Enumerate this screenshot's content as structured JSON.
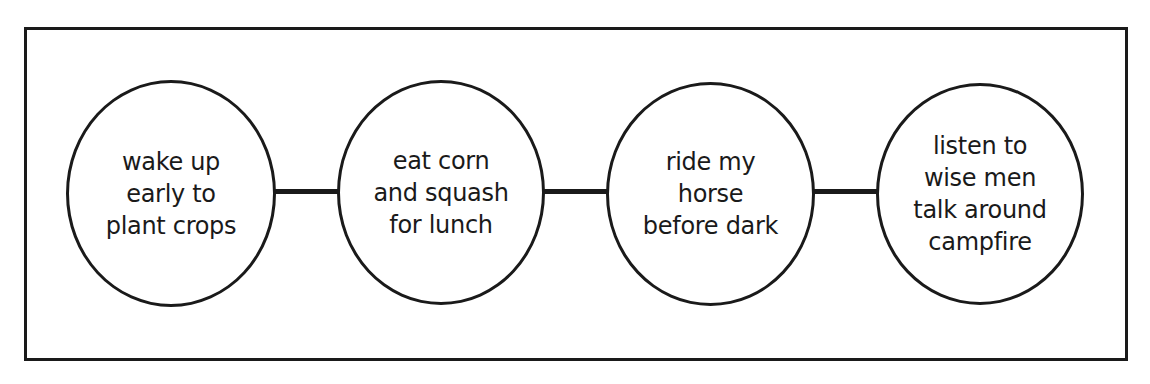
{
  "diagram": {
    "type": "sequence-chain",
    "nodes": [
      {
        "label": "wake up\nearly to\nplant crops"
      },
      {
        "label": "eat corn\nand squash\nfor lunch"
      },
      {
        "label": "ride my\nhorse\nbefore dark"
      },
      {
        "label": "listen to\nwise men\ntalk around\ncampfire"
      }
    ],
    "colors": {
      "stroke": "#1a1a1a",
      "background": "#ffffff"
    }
  }
}
